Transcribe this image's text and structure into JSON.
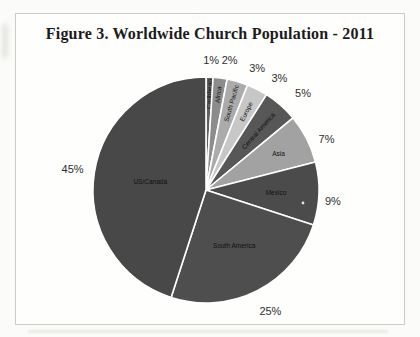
{
  "figure": {
    "title": "Figure 3. Worldwide Church Population - 2011"
  },
  "chart_data": {
    "type": "pie",
    "title": "Figure 3. Worldwide Church Population - 2011",
    "start_angle_deg": 0,
    "direction": "clockwise",
    "total": 100,
    "legend": "none",
    "slices": [
      {
        "label": "Caribbean",
        "value": 1,
        "pct_label": "1%",
        "color": "#606060",
        "label_rotated": true,
        "label_r": 0.85,
        "pct_offset": [
          1,
          3
        ]
      },
      {
        "label": "Africa",
        "value": 2,
        "pct_label": "2%",
        "color": "#8c8c8c",
        "label_rotated": true,
        "label_r": 0.85,
        "pct_offset": [
          7,
          2
        ]
      },
      {
        "label": "South Pacific",
        "value": 3,
        "pct_label": "3%",
        "color": "#ababab",
        "label_rotated": true,
        "label_r": 0.8,
        "pct_offset": [
          14,
          6
        ]
      },
      {
        "label": "Europe",
        "value": 3,
        "pct_label": "3%",
        "color": "#c7c7c7",
        "label_rotated": true,
        "label_r": 0.78,
        "pct_offset": [
          13,
          6
        ]
      },
      {
        "label": "Central America",
        "value": 5,
        "pct_label": "5%",
        "color": "#575757",
        "label_rotated": true,
        "label_r": 0.7,
        "pct_offset": [
          9,
          3
        ]
      },
      {
        "label": "Asia",
        "value": 7,
        "pct_label": "7%",
        "color": "#a2a2a2",
        "label_rotated": false,
        "label_r": 0.72,
        "pct_offset": [
          2,
          9
        ]
      },
      {
        "label": "Mexico",
        "value": 9,
        "pct_label": "9%",
        "color": "#4b4b4b",
        "label_rotated": false,
        "label_r": 0.62,
        "pct_offset": [
          -6,
          7
        ]
      },
      {
        "label": "South America",
        "value": 25,
        "pct_label": "25%",
        "color": "#4e4e4e",
        "label_rotated": false,
        "label_r": 0.55,
        "pct_offset": [
          4,
          2
        ]
      },
      {
        "label": "US/Canada",
        "value": 45,
        "pct_label": "45%",
        "color": "#484848",
        "label_rotated": false,
        "label_r": 0.5,
        "pct_offset": [
          -2,
          0
        ]
      }
    ]
  }
}
